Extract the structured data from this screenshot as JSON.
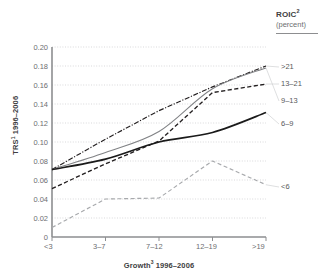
{
  "legend_header": {
    "title": "ROIC",
    "title_sup": "2",
    "subtitle": "(percent)"
  },
  "axes": {
    "y_title": "TRS",
    "y_title_sup": "1",
    "y_title_rest": " 1996–2006",
    "x_title": "Growth",
    "x_title_sup": "3",
    "x_title_rest": " 1996–2006",
    "y_ticks": [
      "0.20",
      "0.18",
      "0.16",
      "0.14",
      "0.12",
      "0.10",
      "0.08",
      "0.06",
      "0.04",
      "0.02",
      "0"
    ],
    "x_ticks": [
      "<3",
      "3–7",
      "7–12",
      "12–19",
      ">19"
    ]
  },
  "series_labels": {
    "s21": ">21",
    "s13_21": "13–21",
    "s9_13": "9–13",
    "s6_9": "6–9",
    "s_lt6": "<6"
  },
  "colors": {
    "axis": "#8d8e90",
    "grid": "#c8c9cb",
    "text": "#6d6e71",
    "bold_text": "#404041",
    "series_gt21": "#231f20",
    "series_13_21": "#231f20",
    "series_9_13": "#808285",
    "series_6_9": "#1a1a1a",
    "series_lt6": "#a7a9ac"
  },
  "chart_data": {
    "type": "line",
    "title": "",
    "xlabel": "Growth3 1996–2006",
    "ylabel": "TRS1 1996–2006",
    "ylim": [
      0,
      0.2
    ],
    "grid": true,
    "legend_position": "right-end-labels",
    "legend_title": "ROIC2 (percent)",
    "categories": [
      "<3",
      "3–7",
      "7–12",
      "12–19",
      ">19"
    ],
    "series": [
      {
        "name": ">21",
        "values": [
          0.071,
          0.103,
          0.133,
          0.158,
          0.18
        ]
      },
      {
        "name": "13–21",
        "values": [
          0.051,
          0.077,
          0.101,
          0.152,
          0.161
        ]
      },
      {
        "name": "9–13",
        "values": [
          0.071,
          0.089,
          0.111,
          0.156,
          0.178
        ]
      },
      {
        "name": "6–9",
        "values": [
          0.071,
          0.082,
          0.1,
          0.11,
          0.131
        ]
      },
      {
        "name": "<6",
        "values": [
          0.01,
          0.04,
          0.041,
          0.08,
          0.055
        ]
      }
    ]
  }
}
